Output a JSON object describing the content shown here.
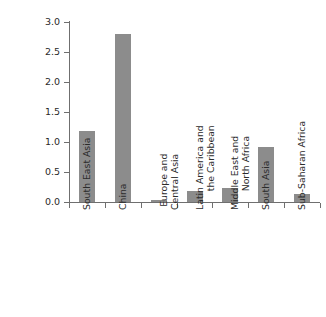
{
  "chart_data": {
    "type": "bar",
    "title": "",
    "subtitle": "",
    "xlabel": "",
    "ylabel": "Percentage Points",
    "categories": [
      "South East Asia",
      "China",
      "Europe and\nCentral Asia",
      "Latin America and\nthe Caribbean",
      "Middle East and\nNorth Africa",
      "South Asia",
      "Sub-Saharan Africa"
    ],
    "values": [
      1.18,
      2.8,
      0.04,
      0.19,
      0.24,
      0.92,
      0.14
    ],
    "ylim": [
      0.0,
      3.0
    ],
    "yticks": [
      "0.0",
      "0.5",
      "1.0",
      "1.5",
      "2.0",
      "2.5",
      "3.0"
    ],
    "ytick_values": [
      0.0,
      0.5,
      1.0,
      1.5,
      2.0,
      2.5,
      3.0
    ],
    "grid": false,
    "legend": null,
    "bar_color": "#8c8c8c",
    "axis_color": "#6f6f6f",
    "background": "#ffffff"
  },
  "axis": {
    "y_title": "Percentage Points"
  }
}
